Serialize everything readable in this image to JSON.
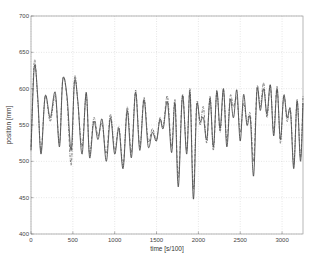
{
  "chart_data": {
    "type": "line",
    "title": "",
    "xlabel": "time [s/100]",
    "ylabel": "position [mm]",
    "xlim": [
      0,
      3250
    ],
    "ylim": [
      400,
      700
    ],
    "xticks": [
      0,
      500,
      1000,
      1500,
      2000,
      2500,
      3000
    ],
    "yticks": [
      400,
      450,
      500,
      550,
      600,
      650,
      700
    ],
    "grid": true,
    "legend": null,
    "series": [
      {
        "name": "measured",
        "style": "solid",
        "x": [
          0,
          40,
          80,
          120,
          170,
          230,
          290,
          340,
          380,
          430,
          480,
          520,
          560,
          610,
          660,
          700,
          750,
          800,
          850,
          900,
          950,
          1000,
          1050,
          1100,
          1150,
          1200,
          1250,
          1300,
          1350,
          1400,
          1450,
          1500,
          1540,
          1580,
          1630,
          1680,
          1720,
          1760,
          1810,
          1860,
          1900,
          1940,
          1980,
          2020,
          2060,
          2100,
          2140,
          2180,
          2220,
          2260,
          2300,
          2340,
          2380,
          2420,
          2460,
          2500,
          2540,
          2580,
          2620,
          2660,
          2700,
          2740,
          2780,
          2820,
          2860,
          2900,
          2940,
          2980,
          3020,
          3060,
          3100,
          3140,
          3180,
          3220,
          3250
        ],
        "y": [
          515,
          630,
          590,
          510,
          590,
          560,
          595,
          520,
          612,
          590,
          515,
          610,
          582,
          510,
          595,
          505,
          555,
          530,
          558,
          500,
          560,
          510,
          545,
          490,
          570,
          505,
          595,
          515,
          585,
          520,
          540,
          528,
          558,
          545,
          582,
          512,
          580,
          465,
          590,
          510,
          595,
          448,
          575,
          555,
          560,
          530,
          586,
          520,
          596,
          545,
          600,
          520,
          585,
          560,
          598,
          528,
          592,
          550,
          560,
          480,
          598,
          570,
          600,
          565,
          605,
          535,
          600,
          530,
          590,
          560,
          570,
          490,
          583,
          500,
          580
        ]
      },
      {
        "name": "estimated",
        "style": "dash-dot",
        "x": [
          0,
          40,
          80,
          120,
          170,
          230,
          290,
          340,
          380,
          430,
          480,
          520,
          560,
          610,
          660,
          700,
          750,
          800,
          850,
          900,
          950,
          1000,
          1050,
          1100,
          1150,
          1200,
          1250,
          1300,
          1350,
          1400,
          1450,
          1500,
          1540,
          1580,
          1630,
          1680,
          1720,
          1760,
          1810,
          1860,
          1900,
          1940,
          1980,
          2020,
          2060,
          2100,
          2140,
          2180,
          2220,
          2260,
          2300,
          2340,
          2380,
          2420,
          2460,
          2500,
          2540,
          2580,
          2620,
          2660,
          2700,
          2740,
          2780,
          2820,
          2860,
          2900,
          2940,
          2980,
          3020,
          3060,
          3100,
          3140,
          3180,
          3220,
          3250
        ],
        "y": [
          520,
          638,
          585,
          515,
          590,
          555,
          590,
          525,
          614,
          585,
          495,
          615,
          580,
          520,
          592,
          510,
          560,
          535,
          552,
          510,
          565,
          515,
          548,
          495,
          575,
          512,
          598,
          520,
          588,
          528,
          545,
          530,
          560,
          548,
          590,
          520,
          585,
          478,
          592,
          515,
          600,
          462,
          580,
          550,
          575,
          525,
          590,
          515,
          598,
          540,
          598,
          528,
          590,
          575,
          588,
          540,
          580,
          555,
          565,
          500,
          602,
          575,
          608,
          560,
          604,
          540,
          603,
          525,
          592,
          555,
          572,
          495,
          585,
          505,
          590
        ]
      }
    ]
  }
}
